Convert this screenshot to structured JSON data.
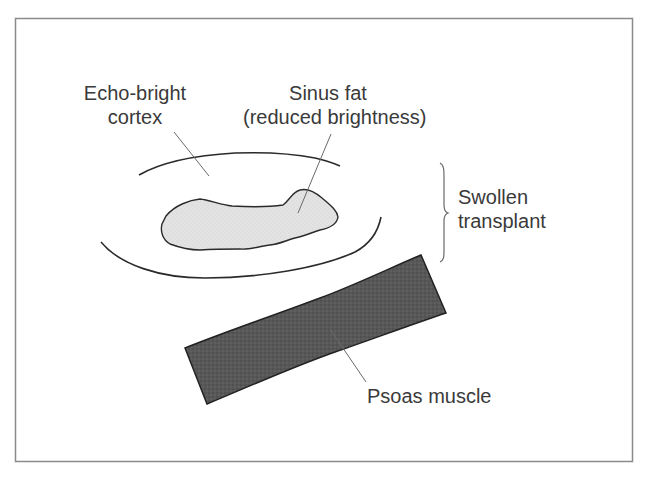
{
  "figure": {
    "type": "schematic diagram",
    "labels": {
      "cortex": {
        "line1": "Echo-bright",
        "line2": "cortex"
      },
      "sinus_fat": {
        "line1": "Sinus fat",
        "line2": "(reduced brightness)"
      },
      "transplant": {
        "line1": "Swollen",
        "line2": "transplant"
      },
      "psoas": {
        "text": "Psoas muscle"
      }
    },
    "colors": {
      "frame": "#8a8a8a",
      "outline": "#2a2a2a",
      "sinus_fill": "#e2e2e2",
      "psoas_fill": "#555555",
      "leader": "#6a6a6a",
      "text": "#3a3a3a"
    }
  }
}
